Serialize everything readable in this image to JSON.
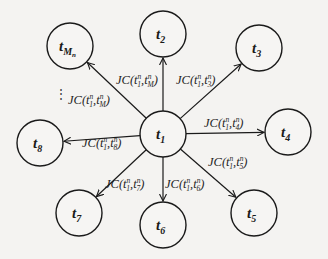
{
  "diagram": {
    "type": "star-graph",
    "center": {
      "id": "t1",
      "base": "t",
      "sub": "1",
      "x": 163,
      "y": 134
    },
    "nodes": [
      {
        "id": "tMn",
        "base": "t",
        "sub": "M",
        "subsub": "n",
        "x": 70,
        "y": 46
      },
      {
        "id": "t2",
        "base": "t",
        "sub": "2",
        "x": 163,
        "y": 34
      },
      {
        "id": "t3",
        "base": "t",
        "sub": "3",
        "x": 259,
        "y": 48
      },
      {
        "id": "t4",
        "base": "t",
        "sub": "4",
        "x": 288,
        "y": 132
      },
      {
        "id": "t5",
        "base": "t",
        "sub": "5",
        "x": 254,
        "y": 213
      },
      {
        "id": "t6",
        "base": "t",
        "sub": "6",
        "x": 163,
        "y": 225
      },
      {
        "id": "t7",
        "base": "t",
        "sub": "7",
        "x": 79,
        "y": 213
      },
      {
        "id": "t8",
        "base": "t",
        "sub": "8",
        "x": 40,
        "y": 143
      }
    ],
    "edges": [
      {
        "from": "t1",
        "to": "tMn",
        "label": "JC(t1^n, tM^n)",
        "a": "1",
        "b": "M",
        "lx": 68,
        "ly": 104
      },
      {
        "from": "t1",
        "to": "t2",
        "label": "JC(t1^n, tM^n)",
        "a": "1",
        "b": "M",
        "lx": 116,
        "ly": 84
      },
      {
        "from": "t1",
        "to": "t3",
        "label": "JC(t1^n, t3^n)",
        "a": "1",
        "b": "3",
        "lx": 176,
        "ly": 84
      },
      {
        "from": "t1",
        "to": "t4",
        "label": "JC(t1^n, t4^n)",
        "a": "1",
        "b": "4",
        "lx": 204,
        "ly": 127
      },
      {
        "from": "t1",
        "to": "t5",
        "label": "JC(t1^n, t5^n)",
        "a": "1",
        "b": "5",
        "lx": 208,
        "ly": 166
      },
      {
        "from": "t1",
        "to": "t6",
        "label": "JC(t1^n, t6^n)",
        "a": "1",
        "b": "6",
        "lx": 165,
        "ly": 188
      },
      {
        "from": "t1",
        "to": "t7",
        "label": "JC(t1^n, t7^n)",
        "a": "1",
        "b": "7",
        "lx": 105,
        "ly": 188
      },
      {
        "from": "t1",
        "to": "t8",
        "label": "JC(t1^n, t8^n)",
        "a": "1",
        "b": "8",
        "lx": 82,
        "ly": 147
      }
    ],
    "ellipsis": {
      "text": "⋮",
      "x": 55,
      "y": 98
    },
    "edge_function": "JC",
    "superscript": "n",
    "node_radius": 23,
    "colors": {
      "stroke": "#1a1a1a",
      "background": "#f4f3f1"
    }
  }
}
